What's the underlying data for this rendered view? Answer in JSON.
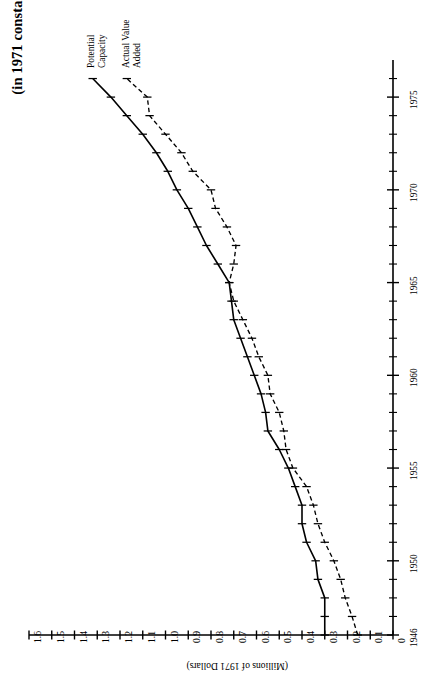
{
  "chart_data": {
    "type": "line",
    "title": "(in 1971 constant dollars)",
    "orientation": "rotated-90-ccw",
    "xlabel": "",
    "ylabel": "(Millions of 1971 Dollars)",
    "xlim": [
      1946,
      1977
    ],
    "ylim": [
      0,
      1.6
    ],
    "grid": false,
    "legend": "inline-labels-at-line-ends",
    "xtick_labels": [
      "1946",
      "1950",
      "1955",
      "1960",
      "1965",
      "1970",
      "1975"
    ],
    "xtick_values": [
      1946,
      1950,
      1955,
      1960,
      1965,
      1970,
      1975
    ],
    "minor_xticks_every": 1,
    "ytick_labels": [
      "0",
      "0.1",
      "0.2",
      "0.3",
      "0.4",
      "0.5",
      "0.6",
      "0.7",
      "0.8",
      "0.9",
      "1.0",
      "1.1",
      "1.2",
      "1.3",
      "1.4",
      "1.5",
      "1.6"
    ],
    "ytick_values": [
      0,
      0.1,
      0.2,
      0.3,
      0.4,
      0.5,
      0.6,
      0.7,
      0.8,
      0.9,
      1.0,
      1.1,
      1.2,
      1.3,
      1.4,
      1.5,
      1.6
    ],
    "x": [
      1946,
      1947,
      1948,
      1949,
      1950,
      1951,
      1952,
      1953,
      1954,
      1955,
      1956,
      1957,
      1958,
      1959,
      1960,
      1961,
      1962,
      1963,
      1964,
      1965,
      1966,
      1967,
      1968,
      1969,
      1970,
      1971,
      1972,
      1973,
      1974,
      1975,
      1976
    ],
    "series": [
      {
        "name": "Potential Capacity",
        "style": "solid",
        "marker": "tick",
        "color": "#000000",
        "values": [
          0.3,
          0.3,
          0.3,
          0.33,
          0.34,
          0.38,
          0.4,
          0.4,
          0.43,
          0.46,
          0.5,
          0.55,
          0.56,
          0.58,
          0.61,
          0.64,
          0.67,
          0.7,
          0.71,
          0.72,
          0.77,
          0.82,
          0.86,
          0.9,
          0.95,
          0.99,
          1.04,
          1.1,
          1.17,
          1.24,
          1.32
        ]
      },
      {
        "name": "Actual Value Added",
        "style": "dashed",
        "marker": "tick",
        "color": "#000000",
        "values": [
          0.155,
          0.18,
          0.21,
          0.23,
          0.26,
          0.3,
          0.33,
          0.35,
          0.38,
          0.44,
          0.47,
          0.48,
          0.5,
          0.54,
          0.55,
          0.59,
          0.62,
          0.66,
          0.7,
          0.72,
          0.7,
          0.69,
          0.73,
          0.78,
          0.8,
          0.88,
          0.93,
          1.0,
          1.07,
          1.08,
          1.17
        ]
      }
    ]
  },
  "annotations": {
    "series_label_1": "Potential\nCapacity",
    "series_label_1_line1": "Potential",
    "series_label_1_line2": "Capacity",
    "series_label_2_line1": "Actual Value",
    "series_label_2_line2": "Added"
  }
}
